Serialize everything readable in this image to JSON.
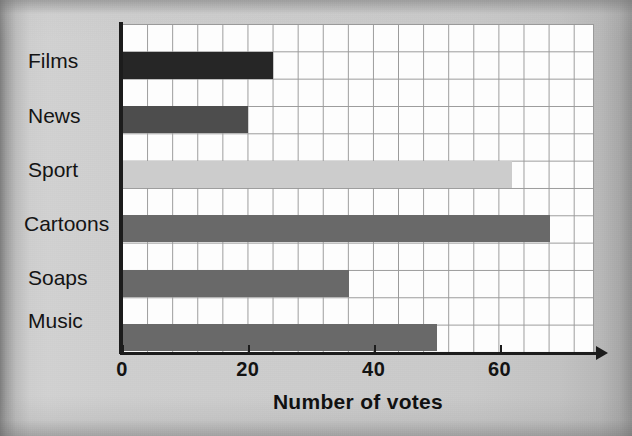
{
  "chart_data": {
    "type": "bar",
    "orientation": "horizontal",
    "title": "",
    "xlabel": "Number of votes",
    "ylabel": "",
    "categories": [
      "Films",
      "News",
      "Sport",
      "Cartoons",
      "Soaps",
      "Music"
    ],
    "values": [
      24,
      20,
      62,
      68,
      36,
      50
    ],
    "bar_colors": [
      "#262626",
      "#4d4d4d",
      "#cccccc",
      "#696969",
      "#696969",
      "#696969"
    ],
    "xlim": [
      0,
      75
    ],
    "xticks": [
      0,
      20,
      40,
      60
    ],
    "xtick_labels": [
      "0",
      "20",
      "40",
      "60"
    ],
    "grid": true,
    "grid_cell_units": 4,
    "legend": "none",
    "plot_background": "#fdfdfd",
    "grid_color": "#9a9a9a",
    "axis_color": "#1c1c1c"
  },
  "axis": {
    "x_title": "Number of votes"
  }
}
